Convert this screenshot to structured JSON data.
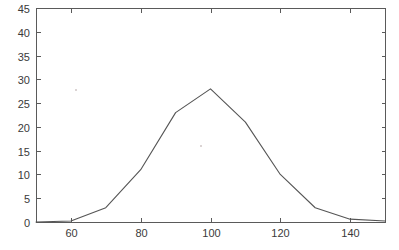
{
  "chart_data": {
    "type": "line",
    "title": "",
    "subtitle": "",
    "xlabel": "",
    "ylabel": "",
    "xlim": [
      50,
      150
    ],
    "ylim": [
      0,
      45
    ],
    "xticks": [
      60,
      80,
      100,
      120,
      140
    ],
    "yticks": [
      0,
      5,
      10,
      15,
      20,
      25,
      30,
      35,
      40,
      45
    ],
    "xtick_labels": [
      "60",
      "80",
      "100",
      "120",
      "140"
    ],
    "ytick_labels": [
      "0",
      "5",
      "10",
      "15",
      "20",
      "25",
      "30",
      "35",
      "40",
      "45"
    ],
    "grid": false,
    "legend": null,
    "legend_position": "none",
    "line_color": "#555555",
    "axis_color": "#5a5a5a",
    "background_color": "#ffffff",
    "series": [
      {
        "name": "distribution",
        "x": [
          50,
          60,
          70,
          80,
          90,
          100,
          110,
          120,
          130,
          140,
          150
        ],
        "values": [
          0,
          0.2,
          3,
          11,
          23,
          28,
          21,
          10,
          3,
          0.6,
          0.2
        ]
      }
    ]
  },
  "annotations": {
    "specks": [
      {
        "x": 76,
        "y": 90
      },
      {
        "x": 201,
        "y": 146
      }
    ]
  }
}
